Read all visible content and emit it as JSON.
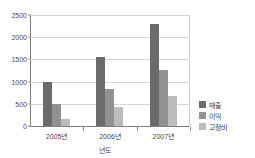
{
  "title_sliver": "　",
  "chart_data": {
    "type": "bar",
    "title": "",
    "xlabel": "년도",
    "ylabel": "",
    "categories": [
      "2005년",
      "2006년",
      "2007년"
    ],
    "series": [
      {
        "name": "매출",
        "color": "#6b6b6b",
        "values": [
          1000,
          1550,
          2300
        ]
      },
      {
        "name": "이익",
        "color": "#919191",
        "values": [
          500,
          830,
          1270
        ]
      },
      {
        "name": "고정비",
        "color": "#bdbdbd",
        "values": [
          150,
          430,
          680
        ]
      }
    ],
    "ylim": [
      0,
      2500
    ],
    "yticks": [
      0,
      500,
      1000,
      1500,
      2000,
      2500
    ],
    "ytick_labels": [
      "0",
      "500",
      "1000",
      "1500",
      "2000",
      "2500"
    ],
    "grid": true,
    "legend_position": "right"
  },
  "colors": {
    "axis": "#7d7d7d",
    "grid": "#d6d6d6",
    "text": "#3f3f3f",
    "background": "#ffffff"
  }
}
